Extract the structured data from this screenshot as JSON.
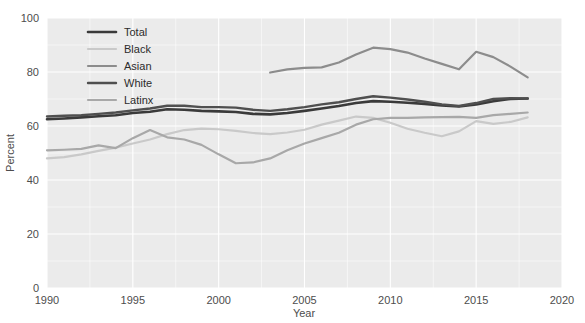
{
  "chart_data": {
    "type": "line",
    "title": "",
    "subtitle": "",
    "xlabel": "Year",
    "ylabel": "Percent",
    "xlim": [
      1990,
      2020
    ],
    "ylim": [
      0,
      100
    ],
    "xticks": [
      1990,
      1995,
      2000,
      2005,
      2010,
      2015,
      2020
    ],
    "xtick_labels": [
      "1990",
      "1995",
      "2000",
      "2005",
      "2010",
      "2015",
      "2020"
    ],
    "yticks": [
      0,
      20,
      40,
      60,
      80,
      100
    ],
    "ytick_labels": [
      "0",
      "20",
      "40",
      "60",
      "80",
      "100"
    ],
    "grid": true,
    "grid_color": "#ffffff",
    "panel_background": "#ebebeb",
    "figure_background": "#ffffff",
    "legend_position": "top-left-inside",
    "series": [
      {
        "name": "Total",
        "color": "#3a3a3a",
        "width": 2.6,
        "x": [
          1990,
          1991,
          1992,
          1993,
          1994,
          1995,
          1996,
          1997,
          1998,
          1999,
          2000,
          2001,
          2002,
          2003,
          2004,
          2005,
          2006,
          2007,
          2008,
          2009,
          2010,
          2011,
          2012,
          2013,
          2014,
          2015,
          2016,
          2017,
          2018
        ],
        "y": [
          62.5,
          62.8,
          63.2,
          63.6,
          64.0,
          64.8,
          65.3,
          66.2,
          66.0,
          65.6,
          65.4,
          65.2,
          64.5,
          64.3,
          64.8,
          65.6,
          66.5,
          67.4,
          68.5,
          69.2,
          69.0,
          68.6,
          68.2,
          67.6,
          67.2,
          68.0,
          69.2,
          70.0,
          70.2
        ]
      },
      {
        "name": "Black",
        "color": "#c9c9c9",
        "width": 2.2,
        "x": [
          1990,
          1991,
          1992,
          1993,
          1994,
          1995,
          1996,
          1997,
          1998,
          1999,
          2000,
          2001,
          2002,
          2003,
          2004,
          2005,
          2006,
          2007,
          2008,
          2009,
          2010,
          2011,
          2012,
          2013,
          2014,
          2015,
          2016,
          2017,
          2018
        ],
        "y": [
          48.0,
          48.5,
          49.5,
          50.8,
          52.0,
          53.5,
          55.0,
          57.0,
          58.5,
          59.0,
          58.8,
          58.2,
          57.4,
          57.0,
          57.6,
          58.6,
          60.5,
          62.0,
          63.5,
          63.0,
          61.2,
          59.0,
          57.5,
          56.2,
          58.0,
          61.8,
          60.8,
          61.5,
          63.2
        ]
      },
      {
        "name": "Asian",
        "color": "#8c8c8c",
        "width": 2.2,
        "x": [
          2003,
          2004,
          2005,
          2006,
          2007,
          2008,
          2009,
          2010,
          2011,
          2012,
          2013,
          2014,
          2015,
          2016,
          2017,
          2018
        ],
        "y": [
          79.8,
          81.0,
          81.5,
          81.7,
          83.5,
          86.5,
          89.0,
          88.5,
          87.2,
          85.0,
          83.0,
          81.0,
          87.5,
          85.5,
          82.0,
          78.0
        ]
      },
      {
        "name": "White",
        "color": "#4f4f4f",
        "width": 2.4,
        "x": [
          1990,
          1991,
          1992,
          1993,
          1994,
          1995,
          1996,
          1997,
          1998,
          1999,
          2000,
          2001,
          2002,
          2003,
          2004,
          2005,
          2006,
          2007,
          2008,
          2009,
          2010,
          2011,
          2012,
          2013,
          2014,
          2015,
          2016,
          2017,
          2018
        ],
        "y": [
          63.5,
          63.8,
          64.0,
          64.5,
          65.0,
          65.8,
          66.5,
          67.5,
          67.5,
          67.0,
          67.0,
          66.8,
          66.0,
          65.6,
          66.2,
          67.0,
          68.0,
          68.8,
          70.0,
          71.0,
          70.5,
          69.8,
          69.0,
          68.0,
          67.4,
          68.5,
          70.0,
          70.3,
          70.2
        ]
      },
      {
        "name": "Latinx",
        "color": "#a8a8a8",
        "width": 2.2,
        "x": [
          1990,
          1991,
          1992,
          1993,
          1994,
          1995,
          1996,
          1997,
          1998,
          1999,
          2000,
          2001,
          2002,
          2003,
          2004,
          2005,
          2006,
          2007,
          2008,
          2009,
          2010,
          2011,
          2012,
          2013,
          2014,
          2015,
          2016,
          2017,
          2018
        ],
        "y": [
          51.0,
          51.2,
          51.5,
          52.8,
          51.8,
          55.5,
          58.5,
          55.8,
          55.0,
          53.0,
          49.5,
          46.2,
          46.5,
          48.0,
          51.0,
          53.5,
          55.5,
          57.5,
          60.5,
          62.5,
          63.0,
          63.0,
          63.2,
          63.3,
          63.4,
          63.0,
          64.0,
          64.5,
          65.0
        ]
      }
    ],
    "legend_entries": [
      {
        "label": "Total",
        "color": "#3a3a3a"
      },
      {
        "label": "Black",
        "color": "#c9c9c9"
      },
      {
        "label": "Asian",
        "color": "#8c8c8c"
      },
      {
        "label": "White",
        "color": "#4f4f4f"
      },
      {
        "label": "Latinx",
        "color": "#a8a8a8"
      }
    ]
  }
}
